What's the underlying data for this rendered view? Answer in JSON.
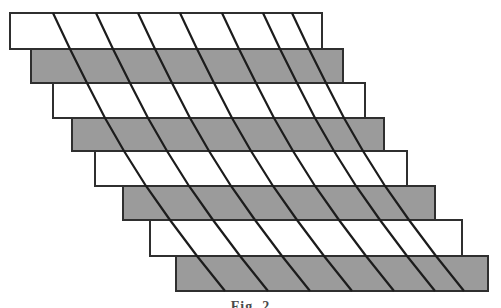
{
  "figure": {
    "caption": "Fig. 2",
    "background_color": "#ffffff",
    "gray_fill": "#9b9b9b",
    "white_fill": "#ffffff",
    "outline_color": "#2f2f2f",
    "diagonal_color": "#1c1c1c",
    "strip_count": 8,
    "diagonal_line_count": 7,
    "strip_width": 312,
    "boundaries_y": [
      13,
      49,
      83,
      118,
      151,
      186,
      220,
      256,
      291
    ],
    "strip_lefts": [
      10,
      31,
      53,
      72,
      95,
      123,
      150,
      176
    ],
    "strip_fills": [
      "white",
      "gray",
      "white",
      "gray",
      "white",
      "gray",
      "white",
      "gray"
    ],
    "diagonal_tops_x": [
      53,
      96,
      138,
      180,
      222,
      263,
      292
    ],
    "diagonal_cumulative_offsets": [
      0,
      17,
      34,
      52,
      71,
      93,
      117,
      144,
      172
    ],
    "outline_stroke_width": 2,
    "diagonal_stroke_width": 2.2
  }
}
